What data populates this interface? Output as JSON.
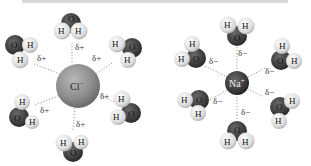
{
  "diagram": {
    "type": "ion-hydration",
    "panels": [
      {
        "name": "chloride",
        "ion": {
          "label": "Cl",
          "charge": "−",
          "cx": 78,
          "cy": 86,
          "r": 22,
          "color": "#8a8a8a"
        },
        "partial_charge_label": "δ+",
        "waters": [
          {
            "cx": 70,
            "cy": 28,
            "label_O": "O",
            "label_H1": "H",
            "label_H2": "H",
            "delta": {
              "x": 76,
              "y": 49
            }
          },
          {
            "cx": 22,
            "cy": 53,
            "label_O": "O",
            "label_H1": "H",
            "label_H2": "H",
            "delta": {
              "x": 37,
              "y": 60
            }
          },
          {
            "cx": 124,
            "cy": 52,
            "label_O": "O",
            "label_H1": "H",
            "label_H2": "H",
            "delta": {
              "x": 92,
              "y": 60
            }
          },
          {
            "cx": 22,
            "cy": 114,
            "label_O": "O",
            "label_H1": "H",
            "label_H2": "H",
            "delta": {
              "x": 40,
              "y": 112
            }
          },
          {
            "cx": 127,
            "cy": 108,
            "label_O": "O",
            "label_H1": "H",
            "label_H2": "H",
            "delta": {
              "x": 100,
              "y": 98
            }
          },
          {
            "cx": 72,
            "cy": 144,
            "label_O": "O",
            "label_H1": "H",
            "label_H2": "H",
            "delta": {
              "x": 76,
              "y": 126
            }
          }
        ]
      },
      {
        "name": "sodium",
        "ion": {
          "label": "Na",
          "charge": "+",
          "cx": 237,
          "cy": 83,
          "r": 12,
          "color": "#3c3c3c"
        },
        "partial_charge_label": "δ−",
        "waters": [
          {
            "cx": 236,
            "cy": 30,
            "label_O": "O",
            "label_H1": "H",
            "label_H2": "H",
            "delta": {
              "x": 238,
              "y": 55
            }
          },
          {
            "cx": 190,
            "cy": 55,
            "label_O": "O",
            "label_H1": "H",
            "label_H2": "H",
            "delta": {
              "x": 209,
              "y": 63
            }
          },
          {
            "cx": 285,
            "cy": 58,
            "label_O": "O",
            "label_H1": "H",
            "label_H2": "H",
            "delta": {
              "x": 264,
              "y": 73
            }
          },
          {
            "cx": 193,
            "cy": 105,
            "label_O": "O",
            "label_H1": "H",
            "label_H2": "H",
            "delta": {
              "x": 213,
              "y": 103
            }
          },
          {
            "cx": 283,
            "cy": 108,
            "label_O": "O",
            "label_H1": "H",
            "label_H2": "H",
            "delta": {
              "x": 265,
              "y": 94
            }
          },
          {
            "cx": 236,
            "cy": 133,
            "label_O": "O",
            "label_H1": "H",
            "label_H2": "H",
            "delta": {
              "x": 241,
              "y": 114
            }
          }
        ]
      }
    ]
  },
  "labels": {
    "cl_ion": "Cl",
    "cl_charge": "−",
    "na_ion": "Na",
    "na_charge": "+",
    "delta_plus": "δ+",
    "delta_minus": "δ−",
    "oxygen": "O",
    "hydrogen": "H"
  },
  "colors": {
    "oxygen": "#3a3a3a",
    "hydrogen": "#e4e4e4",
    "cl_ion": "#8c8c8c",
    "na_ion": "#3a3a3a",
    "dotted_line": "#9a9a9a",
    "top_bar": "#d8d8d8"
  }
}
